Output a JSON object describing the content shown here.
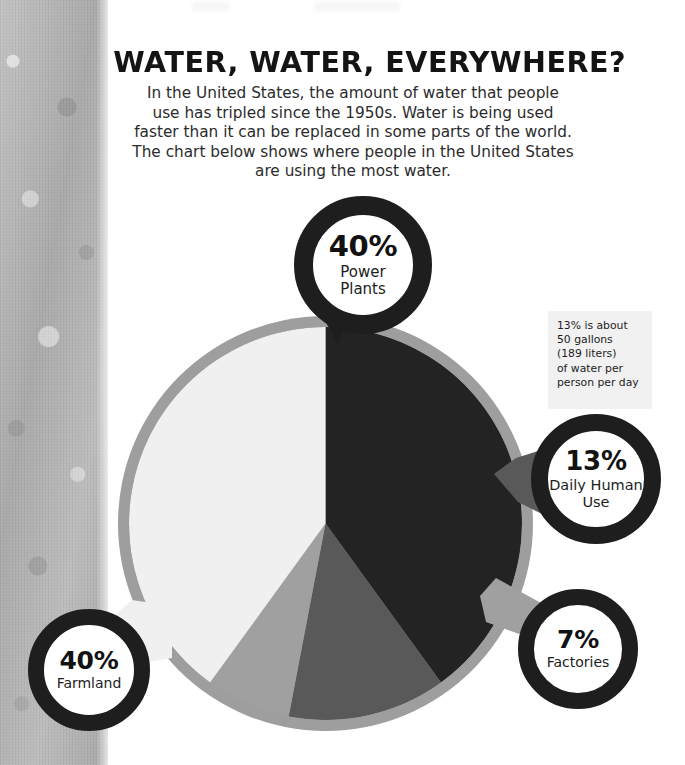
{
  "header": {
    "title": "WATER, WATER, EVERYWHERE?",
    "subtitle_lines": [
      "In the United States, the amount of water that people",
      "use has tripled since the 1950s. Water is being used",
      "faster than it can be replaced in some parts of the world.",
      "The chart below shows where people in the United States",
      "are using the most water."
    ]
  },
  "note_box": {
    "lines": [
      "13% is about",
      "50 gallons",
      "(189 liters)",
      "of water per",
      "person per day"
    ]
  },
  "callouts": {
    "power_plants": {
      "percent": "40%",
      "label_line1": "Power",
      "label_line2": "Plants"
    },
    "daily_human_use": {
      "percent": "13%",
      "label_line1": "Daily Human",
      "label_line2": "Use"
    },
    "factories": {
      "percent": "7%",
      "label_line1": "Factories",
      "label_line2": ""
    },
    "farmland": {
      "percent": "40%",
      "label_line1": "Farmland",
      "label_line2": ""
    }
  },
  "chart_data": {
    "type": "pie",
    "title": "WATER, WATER, EVERYWHERE?",
    "categories": [
      "Power Plants",
      "Daily Human Use",
      "Factories",
      "Farmland"
    ],
    "values": [
      40,
      13,
      7,
      40
    ],
    "unit": "percent",
    "start_angle_deg": 0,
    "direction": "clockwise",
    "legend": "callout-badges",
    "grid": false,
    "colors": {
      "power_plants": "#232323",
      "daily_human_use": "#595959",
      "factories": "#a0a0a0",
      "farmland": "#f0f0f0",
      "ring": "#9e9e9e",
      "badge_ring": "#1e1e1e",
      "note_box_bg": "#f1f1f1",
      "background": "#ffffff",
      "texture_strip": "#b4b4b4"
    },
    "slice_angles_deg": {
      "power_plants": [
        0,
        144
      ],
      "daily_human_use": [
        144,
        190.8
      ],
      "factories": [
        190.8,
        216
      ],
      "farmland": [
        216,
        360
      ]
    }
  }
}
